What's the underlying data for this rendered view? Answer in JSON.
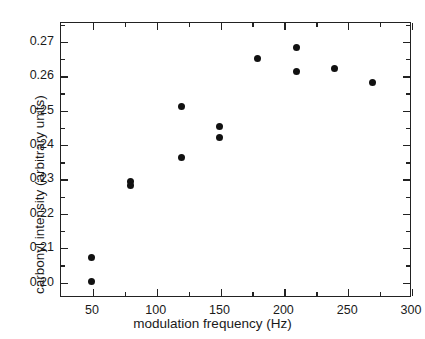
{
  "chart_data": {
    "type": "scatter",
    "title": "",
    "xlabel": "modulation frequency (Hz)",
    "ylabel": "carbonyl intensity (arbitrary units)",
    "xlim": [
      25,
      300
    ],
    "ylim": [
      0.1955,
      0.2755
    ],
    "grid": false,
    "legend": null,
    "marker": {
      "shape": "circle",
      "color": "#111111",
      "size": 7
    },
    "xticks": [
      50,
      100,
      150,
      200,
      250,
      300
    ],
    "xtick_labels": [
      "50",
      "100",
      "150",
      "200",
      "250",
      "300"
    ],
    "xminor_ticks": [
      75,
      125,
      175,
      225,
      275
    ],
    "yticks": [
      0.2,
      0.21,
      0.22,
      0.23,
      0.24,
      0.25,
      0.26,
      0.27
    ],
    "ytick_labels": [
      "0.20",
      "0.21",
      "0.22",
      "0.23",
      "0.24",
      "0.25",
      "0.26",
      "0.27"
    ],
    "yminor_ticks": [
      0.205,
      0.215,
      0.225,
      0.235,
      0.245,
      0.255,
      0.265,
      0.275
    ],
    "series": [
      {
        "name": "carbonyl intensity",
        "points": [
          {
            "x": 50,
            "y": 0.207
          },
          {
            "x": 50,
            "y": 0.2
          },
          {
            "x": 80,
            "y": 0.229
          },
          {
            "x": 80,
            "y": 0.228
          },
          {
            "x": 120,
            "y": 0.251
          },
          {
            "x": 120,
            "y": 0.236
          },
          {
            "x": 150,
            "y": 0.245
          },
          {
            "x": 150,
            "y": 0.242
          },
          {
            "x": 180,
            "y": 0.265
          },
          {
            "x": 210,
            "y": 0.268
          },
          {
            "x": 210,
            "y": 0.261
          },
          {
            "x": 240,
            "y": 0.262
          },
          {
            "x": 270,
            "y": 0.258
          }
        ]
      }
    ]
  },
  "colors": {
    "axis": "#222222",
    "marker": "#111111",
    "text": "#1a1a1a",
    "background": "#ffffff"
  }
}
